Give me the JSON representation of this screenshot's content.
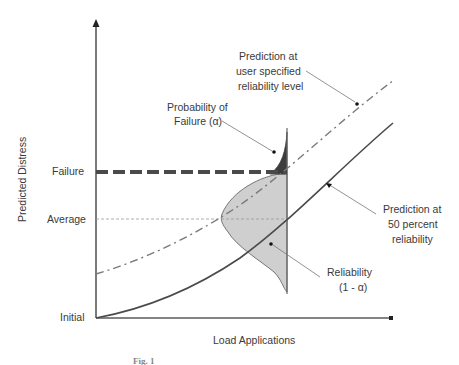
{
  "figure": {
    "type": "reliability-concept-diagram",
    "y_axis": {
      "label": "Predicted Distress",
      "levels": [
        {
          "key": "failure",
          "label": "Failure"
        },
        {
          "key": "average",
          "label": "Average"
        },
        {
          "key": "initial",
          "label": "Initial"
        }
      ]
    },
    "x_axis": {
      "label": "Load Applications"
    },
    "annotations": {
      "probability_of_failure": {
        "line1": "Probability of",
        "line2": "Failure (α)"
      },
      "user_specified": {
        "line1": "Prediction at",
        "line2": "user specified",
        "line3": "reliability level"
      },
      "fifty_percent": {
        "line1": "Prediction at",
        "line2": "50 percent",
        "line3": "reliability"
      },
      "reliability": {
        "line1": "Reliability",
        "line2": "(1 - α)"
      }
    },
    "series": [
      {
        "name": "Prediction at 50 percent reliability",
        "style": "solid",
        "color": "#4a4a4a"
      },
      {
        "name": "Prediction at user specified reliability level",
        "style": "dash-dot",
        "color": "#7a7a7a"
      }
    ],
    "distribution": {
      "reliability_fill": "#cfcfcf",
      "failure_fill": "#3c3c3c"
    },
    "caption": "Fig. 1"
  }
}
